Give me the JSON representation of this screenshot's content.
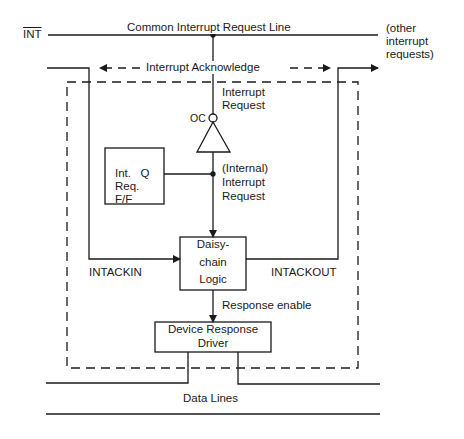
{
  "labels": {
    "int_signal": "INT",
    "common_line": "Common Interrupt Request Line",
    "other_requests": [
      "(other",
      "interrupt",
      "requests)"
    ],
    "interrupt_ack": "Interrupt  Acknowledge",
    "interrupt_request": [
      "Interrupt",
      "Request"
    ],
    "oc": "OC",
    "internal_request": [
      "(Internal)",
      "Interrupt",
      "Request"
    ],
    "ff_box": [
      "Int.   Q",
      "Req.",
      "F/F"
    ],
    "daisy_chain": [
      "Daisy-",
      "chain",
      "Logic"
    ],
    "intackin": "INTACKIN",
    "intackout": "INTACKOUT",
    "response_enable": "Response enable",
    "driver_box": [
      "Device Response",
      "Driver"
    ],
    "data_lines": "Data Lines"
  },
  "colors": {
    "line": "#1a1a1a",
    "background": "#ffffff"
  }
}
